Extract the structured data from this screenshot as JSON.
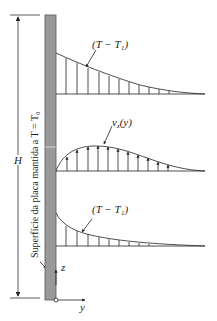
{
  "diagram": {
    "type": "free-convection-boundary-layer",
    "plate": {
      "fill": "#999999",
      "stroke": "#555555"
    },
    "labels": {
      "top_profile": "(T − T₁)",
      "velocity_profile": "v",
      "velocity_sub": "z",
      "velocity_arg": "(y)",
      "bottom_profile": "(T − T₁)",
      "height": "H",
      "plate_caption": "Superfície da placa mantida a T = T₀",
      "z_axis": "z",
      "y_axis": "y"
    }
  }
}
